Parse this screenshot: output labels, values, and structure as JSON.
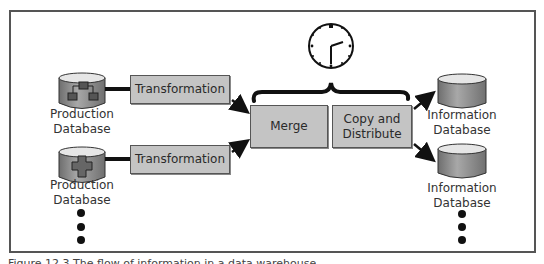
{
  "diagram": {
    "type": "data-flow",
    "sources": [
      {
        "label_line1": "Production",
        "label_line2": "Database",
        "icon": "database-hierarchy-icon"
      },
      {
        "label_line1": "Production",
        "label_line2": "Database",
        "icon": "database-cross-icon"
      }
    ],
    "transforms": [
      {
        "label": "Transformation"
      },
      {
        "label": "Transformation"
      }
    ],
    "merge": {
      "label": "Merge"
    },
    "distribute": {
      "label_line1": "Copy and",
      "label_line2": "Distribute"
    },
    "targets": [
      {
        "label_line1": "Information",
        "label_line2": "Database",
        "icon": "database-icon"
      },
      {
        "label_line1": "Information",
        "label_line2": "Database",
        "icon": "database-icon"
      }
    ],
    "schedule": {
      "icon": "clock-icon",
      "time_shown": "3:00"
    },
    "more_sources_indicator": "ellipsis-vertical",
    "more_targets_indicator": "ellipsis-vertical"
  },
  "colors": {
    "box_fill": "#c4c4c4",
    "frame_border": "#555555",
    "db_body": "#8e8e8e",
    "db_top": "#e6e6e6",
    "arrow": "#111111"
  },
  "caption": "Figure 12.3  The flow of information in a data warehouse"
}
